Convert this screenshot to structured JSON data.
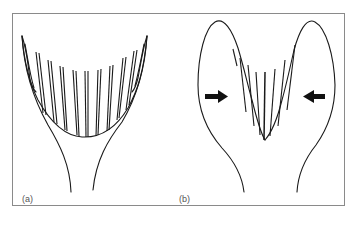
{
  "figure": {
    "panels": [
      {
        "id": "a",
        "label": "(a)",
        "description": "open cup with many ribs"
      },
      {
        "id": "b",
        "label": "(b)",
        "description": "compressed cup with inward arrows"
      }
    ],
    "arrows": [
      {
        "panel": "b",
        "direction": "right",
        "icon": "arrow-right-icon"
      },
      {
        "panel": "b",
        "direction": "left",
        "icon": "arrow-left-icon"
      }
    ],
    "colors": {
      "line": "#1a1a1a",
      "frame": "#8a8a8a",
      "label": "#555555",
      "background": "#ffffff"
    }
  }
}
